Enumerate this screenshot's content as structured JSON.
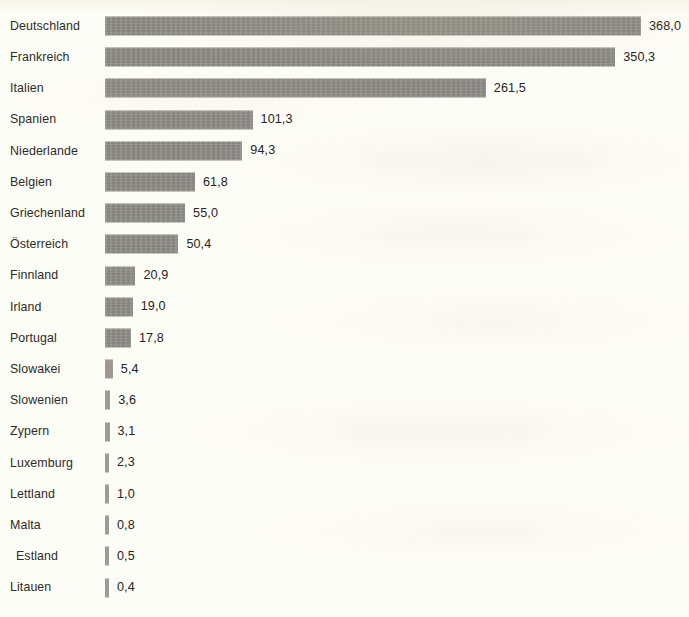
{
  "chart_data": {
    "type": "bar",
    "orientation": "horizontal",
    "title": "",
    "subtitle": "",
    "xlabel": "",
    "ylabel": "",
    "grid": false,
    "legend": null,
    "decimal_separator": ",",
    "axis_range": [
      0,
      368.0
    ],
    "value_label_position": "outside-end",
    "sort_order": "descending",
    "categories": [
      "Deutschland",
      "Frankreich",
      "Italien",
      "Spanien",
      "Niederlande",
      "Belgien",
      "Griechenland",
      "Österreich",
      "Finnland",
      "Irland",
      "Portugal",
      "Slowakei",
      "Slowenien",
      "Zypern",
      "Luxemburg",
      "Lettland",
      "Malta",
      "Estland",
      "Litauen"
    ],
    "values": [
      368.0,
      350.3,
      261.5,
      101.3,
      94.3,
      61.8,
      55.0,
      50.4,
      20.9,
      19.0,
      17.8,
      5.4,
      3.6,
      3.1,
      2.3,
      1.0,
      0.8,
      0.5,
      0.4
    ],
    "value_labels": [
      "368,0",
      "350,3",
      "261,5",
      "101,3",
      "94,3",
      "61,8",
      "55,0",
      "50,4",
      "20,9",
      "19,0",
      "17,8",
      "5,4",
      "3,6",
      "3,1",
      "2,3",
      "1,0",
      "0,8",
      "0,5",
      "0,4"
    ]
  },
  "style": {
    "bar_color": "#8e8c86",
    "background_color": "#fdfdf7",
    "text_color": "#2e2c2a",
    "value_text_color": "#262421"
  }
}
